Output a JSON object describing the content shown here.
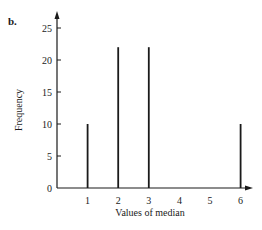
{
  "panel_label": "b.",
  "chart_data": {
    "type": "bar",
    "style": "spike",
    "title": "",
    "xlabel": "Values of median",
    "ylabel": "Frequency",
    "x": [
      1,
      2,
      3,
      6
    ],
    "values": [
      10,
      22,
      22,
      10
    ],
    "xticks": [
      "1",
      "2",
      "3",
      "4",
      "5",
      "6"
    ],
    "yticks": [
      "0",
      "5",
      "10",
      "15",
      "20",
      "25"
    ],
    "xlim": [
      0,
      6.5
    ],
    "ylim": [
      0,
      26
    ],
    "grid": false,
    "legend": null
  }
}
